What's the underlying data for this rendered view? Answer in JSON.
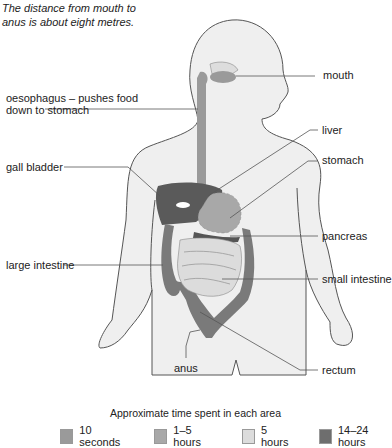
{
  "caption": "The distance from mouth to anus is about eight metres.",
  "labels": {
    "mouth": "mouth",
    "oesophagus_line1": "oesophagus – pushes food",
    "oesophagus_line2": "down to stomach",
    "liver": "liver",
    "stomach": "stomach",
    "gall_bladder": "gall bladder",
    "pancreas": "pancreas",
    "large_intestine": "large intestine",
    "small_intestine": "small intestine",
    "anus": "anus",
    "rectum": "rectum"
  },
  "legend": {
    "title": "Approximate time spent in each area",
    "items": [
      {
        "label": "10 seconds",
        "color": "#9a9a9a"
      },
      {
        "label": "1–5 hours",
        "color": "#a8a8a8"
      },
      {
        "label": "5 hours",
        "color": "#dcdcdc"
      },
      {
        "label": "14–24 hours",
        "color": "#6e6e6e"
      }
    ]
  },
  "colors": {
    "body_fill": "#efefef",
    "outline": "#555555",
    "oesophagus": "#9a9a9a",
    "stomach": "#a8a8a8",
    "liver": "#5a5a5a",
    "large_intestine": "#7a7a7a",
    "small_intestine": "#dcdcdc"
  }
}
